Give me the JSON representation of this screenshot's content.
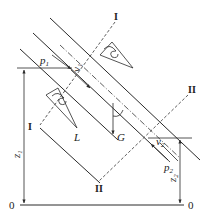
{
  "diagram": {
    "title": "",
    "labels": {
      "p1": "p",
      "p1_sub": "1",
      "v1": "v",
      "v1_sub": "1",
      "p2": "p",
      "p2_sub": "2",
      "v2": "v",
      "v2_sub": "2",
      "z1": "z",
      "z1_sub": "1",
      "z2": "z",
      "z2_sub": "2",
      "L": "L",
      "G": "G",
      "section1_top": "I",
      "section1_bottom": "I",
      "section2_top": "II",
      "section2_bottom": "II",
      "datum_left": "0",
      "datum_right": "0"
    },
    "elements": [
      "inclined-pipe",
      "pipe-centerline",
      "section-1-1",
      "section-2-2",
      "velocity-profile-upper",
      "velocity-profile-lower",
      "datum-line-0-0",
      "height-z1",
      "height-z2",
      "gravity-vector-G",
      "length-L"
    ],
    "colors": {
      "ink": "#2a2a2a",
      "background": "#ffffff"
    }
  }
}
